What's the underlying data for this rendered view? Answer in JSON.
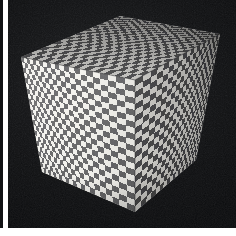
{
  "figure": {
    "kind": "photograph",
    "caption": "",
    "background_color": "#090a0c",
    "page_color": "#ffffff",
    "border_color": "#111214"
  },
  "scene": {
    "background_label": "black backdrop",
    "lighting": "key light from upper left",
    "grain": "visible film / scan grain"
  },
  "object": {
    "name": "cube",
    "texture": "checkerboard",
    "checker_counts": {
      "across": 22,
      "down": 22
    },
    "projection": "perspective",
    "faces": [
      {
        "id": "top",
        "label": "top face",
        "shade": "#a9a9a9",
        "light_color": "#e2e1dd",
        "dark_color": "#4a4a4c",
        "visible": true
      },
      {
        "id": "left",
        "label": "left face",
        "shade": "#d8d7d2",
        "light_color": "#f2f1ec",
        "dark_color": "#5b5b5d",
        "visible": true
      },
      {
        "id": "right",
        "label": "right face",
        "shade": "#8e8e90",
        "light_color": "#cfcec9",
        "dark_color": "#3b3b3d",
        "visible": true
      }
    ],
    "vertices": {
      "top_apex": [
        120,
        16
      ],
      "top_left": [
        21,
        57
      ],
      "top_right": [
        220,
        34
      ],
      "center_front": [
        135,
        80
      ],
      "bottom_left": [
        42,
        172
      ],
      "bottom_front": [
        135,
        212
      ],
      "bottom_right": [
        196,
        160
      ]
    }
  },
  "chart_data": {
    "type": "scatter",
    "title": "",
    "xlabel": "",
    "ylabel": "",
    "categories": [],
    "values": []
  }
}
